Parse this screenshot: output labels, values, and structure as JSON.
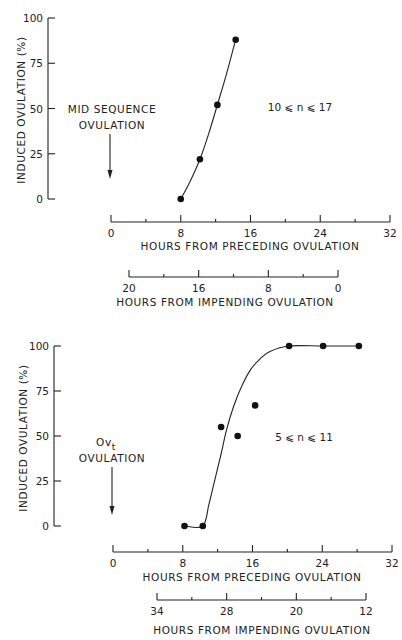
{
  "chart_data": [
    {
      "type": "scatter",
      "title": "",
      "ylabel": "INDUCED OVULATION (%)",
      "xlabel": "HOURS FROM PRECEDING OVULATION",
      "x2label": "HOURS FROM IMPENDING OVULATION",
      "xlim": [
        0,
        32
      ],
      "ylim": [
        0,
        100
      ],
      "xticks": [
        0,
        8,
        16,
        24,
        32
      ],
      "xtick_labels": [
        "0",
        "8",
        "16",
        "24",
        "32"
      ],
      "yticks": [
        0,
        25,
        50,
        75,
        100
      ],
      "ytick_labels": [
        "0",
        "25",
        "50",
        "75",
        "100"
      ],
      "x2ticks": [
        "20",
        "16",
        "8",
        "0"
      ],
      "annotation": {
        "line1": "MID SEQUENCE",
        "line2": "OVULATION",
        "arrow_x": 0
      },
      "n_label": "10 ⩽ n ⩽ 17",
      "grid": false,
      "points": [
        {
          "x": 8.0,
          "y": 0
        },
        {
          "x": 10.2,
          "y": 22
        },
        {
          "x": 12.2,
          "y": 52
        },
        {
          "x": 14.3,
          "y": 88
        }
      ],
      "fit_curve": [
        {
          "x": 8.0,
          "y": 0
        },
        {
          "x": 9.0,
          "y": 9
        },
        {
          "x": 10.2,
          "y": 22
        },
        {
          "x": 11.2,
          "y": 36
        },
        {
          "x": 12.2,
          "y": 52
        },
        {
          "x": 13.3,
          "y": 70
        },
        {
          "x": 14.3,
          "y": 88
        }
      ]
    },
    {
      "type": "scatter",
      "title": "",
      "ylabel": "INDUCED OVULATION (%)",
      "xlabel": "HOURS FROM PRECEDING OVULATION",
      "x2label": "HOURS FROM IMPENDING OVULATION",
      "xlim": [
        0,
        32
      ],
      "ylim": [
        0,
        100
      ],
      "xticks": [
        0,
        8,
        16,
        24,
        32
      ],
      "xtick_labels": [
        "0",
        "8",
        "16",
        "24",
        "32"
      ],
      "yticks": [
        0,
        25,
        50,
        75,
        100
      ],
      "ytick_labels": [
        "0",
        "25",
        "50",
        "75",
        "100"
      ],
      "x2ticks": [
        "34",
        "28",
        "20",
        "12"
      ],
      "annotation": {
        "line1_main": "Ov",
        "line1_sub": "t",
        "line2": "OVULATION"
      },
      "n_label": "5 ⩽ n ⩽ 11",
      "grid": false,
      "points": [
        {
          "x": 8.2,
          "y": 0
        },
        {
          "x": 10.3,
          "y": 0
        },
        {
          "x": 12.4,
          "y": 55
        },
        {
          "x": 14.3,
          "y": 50
        },
        {
          "x": 16.3,
          "y": 67
        },
        {
          "x": 20.2,
          "y": 100
        },
        {
          "x": 24.1,
          "y": 100
        },
        {
          "x": 28.2,
          "y": 100
        }
      ],
      "fit_curve": [
        {
          "x": 8.2,
          "y": 0
        },
        {
          "x": 10.3,
          "y": 0
        },
        {
          "x": 11.0,
          "y": 12
        },
        {
          "x": 11.7,
          "y": 26
        },
        {
          "x": 12.4,
          "y": 40
        },
        {
          "x": 13.0,
          "y": 53
        },
        {
          "x": 13.8,
          "y": 66
        },
        {
          "x": 14.8,
          "y": 78
        },
        {
          "x": 15.8,
          "y": 87
        },
        {
          "x": 16.9,
          "y": 93
        },
        {
          "x": 18.0,
          "y": 97
        },
        {
          "x": 20.2,
          "y": 100
        },
        {
          "x": 24.1,
          "y": 100
        },
        {
          "x": 28.2,
          "y": 100
        }
      ]
    }
  ]
}
